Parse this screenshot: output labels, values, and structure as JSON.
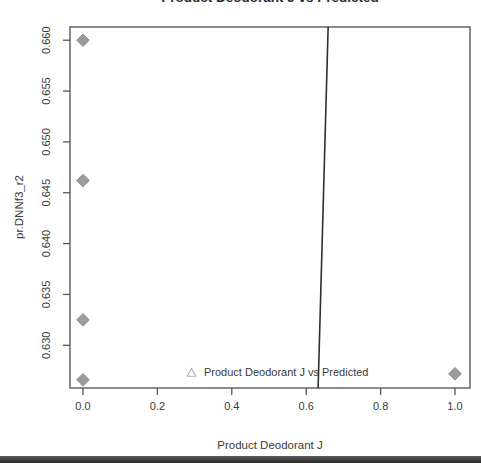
{
  "chart_data": {
    "type": "scatter",
    "title": "Product Deodorant J vs Predicted",
    "xlabel": "Product Deodorant J",
    "ylabel": "pr.DNNf3_r2",
    "xlim": [
      -0.0349,
      1.0403
    ],
    "ylim": [
      0.6258,
      0.6613
    ],
    "grid": false,
    "x_ticks": [
      {
        "value": 0.0,
        "label": "0.0"
      },
      {
        "value": 0.2,
        "label": "0.2"
      },
      {
        "value": 0.4,
        "label": "0.4"
      },
      {
        "value": 0.6,
        "label": "0.6"
      },
      {
        "value": 0.8,
        "label": "0.8"
      },
      {
        "value": 1.0,
        "label": "1.0"
      }
    ],
    "y_ticks": [
      {
        "value": 0.63,
        "label": "0.630"
      },
      {
        "value": 0.635,
        "label": "0.635"
      },
      {
        "value": 0.64,
        "label": "0.640"
      },
      {
        "value": 0.645,
        "label": "0.645"
      },
      {
        "value": 0.65,
        "label": "0.650"
      },
      {
        "value": 0.655,
        "label": "0.655"
      },
      {
        "value": 0.66,
        "label": "0.660"
      }
    ],
    "series": [
      {
        "name": "observed-points",
        "marker": "diamond-filled",
        "marker_color": "#9c9c9c",
        "marker_edge_color": "#8f8f8f",
        "points": [
          [
            0.0,
            0.66
          ],
          [
            0.0,
            0.6462
          ],
          [
            0.0,
            0.6325
          ],
          [
            0.0,
            0.6266
          ],
          [
            1.0,
            0.6272
          ]
        ]
      }
    ],
    "fit_line": {
      "color": "#2e2e2e",
      "width": 1.6,
      "endpoints": [
        [
          0.659,
          0.6613
        ],
        [
          0.632,
          0.6258
        ]
      ]
    },
    "legend": {
      "marker": "triangle-open",
      "marker_color": "#b3b3b3",
      "label": "Product Deodorant J vs Predicted",
      "position": "bottom-center-inside"
    },
    "colors": {
      "border": "#666666",
      "ticks": "#555555",
      "text": "#3a3a3a",
      "background": "#ffffff"
    }
  },
  "window": {
    "bottom_bar": ""
  }
}
